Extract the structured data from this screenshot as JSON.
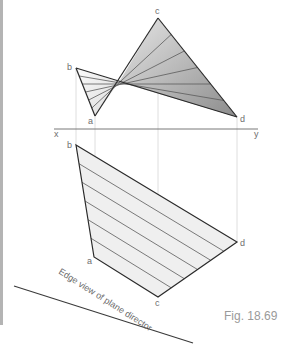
{
  "figure": {
    "caption": "Fig. 18.69",
    "edge_view_label": "Edge view of plane director",
    "reference_line": {
      "left_label": "x",
      "right_label": "y"
    },
    "top_view": {
      "points": {
        "a": "a",
        "b": "b",
        "c": "c",
        "d": "d"
      }
    },
    "front_view": {
      "points": {
        "a": "a",
        "b": "b",
        "c": "c",
        "d": "d"
      }
    },
    "colors": {
      "outline": "#2a2a2a",
      "ruling": "#5a5a5a",
      "projector": "#d4d4d4",
      "shade_light": "#f0f0f0",
      "shade_dark": "#9a9a9a",
      "page_bar": "#b4b4b4"
    },
    "ruling_count": 5
  }
}
